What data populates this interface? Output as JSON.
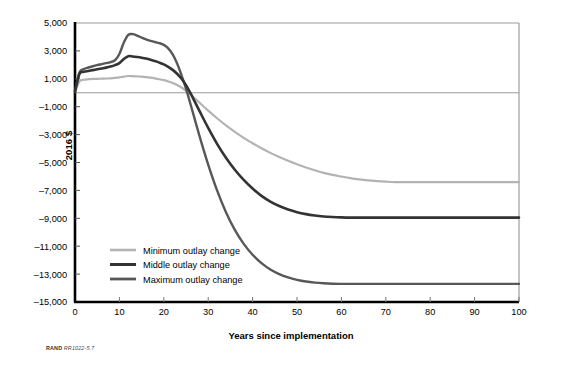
{
  "figure": {
    "source_prefix": "RAND",
    "source_id": "RR1022-5.7"
  },
  "chart_data": {
    "type": "line",
    "title": "",
    "xlabel": "Years since implementation",
    "ylabel": "2016 $",
    "xlim": [
      0,
      100
    ],
    "ylim": [
      -15000,
      5000
    ],
    "xticks": [
      0,
      10,
      20,
      30,
      40,
      50,
      60,
      70,
      80,
      90,
      100
    ],
    "xticklabels": [
      "0",
      "10",
      "20",
      "30",
      "40",
      "50",
      "60",
      "70",
      "80",
      "90",
      "100"
    ],
    "yticks": [
      5000,
      3000,
      1000,
      -1000,
      -3000,
      -5000,
      -7000,
      -9000,
      -11000,
      -13000,
      -15000
    ],
    "yticklabels": [
      "5,000",
      "3,000",
      "1,000",
      "–1,000",
      "–3,000",
      "–5,000",
      "–7,000",
      "–9,000",
      "–11,000",
      "–13,000",
      "–15,000"
    ],
    "grid": "horizontal gridlines at 5,000 (top frame) and 0 (zero reference line)",
    "zero_line": 0,
    "legend_position": "inside lower-left",
    "colors": {
      "minimum": "#b3b3b3",
      "middle": "#333333",
      "maximum": "#585858",
      "axis": "#000000",
      "gridline": "#9a9a9a",
      "frame": "#8a8a8a"
    },
    "x": [
      0,
      1,
      2,
      3,
      4,
      5,
      6,
      7,
      8,
      9,
      10,
      11,
      12,
      13,
      14,
      15,
      16,
      17,
      18,
      19,
      20,
      21,
      22,
      23,
      24,
      25,
      26,
      28,
      30,
      32,
      34,
      36,
      38,
      40,
      42,
      44,
      46,
      48,
      50,
      52,
      54,
      56,
      58,
      60,
      62,
      64,
      66,
      68,
      70,
      72,
      75,
      80,
      85,
      90,
      95,
      100
    ],
    "series": [
      {
        "name": "Minimum outlay change",
        "color": "#b3b3b3",
        "linewidth": 2.2,
        "plateau_value": -6400,
        "plateau_start_year": 72,
        "zero_crossing_year": 24,
        "peak_value": 1200,
        "peak_year": 12,
        "values": [
          50,
          800,
          930,
          970,
          990,
          1000,
          1010,
          1020,
          1030,
          1060,
          1100,
          1160,
          1200,
          1190,
          1170,
          1150,
          1120,
          1080,
          1030,
          970,
          900,
          810,
          700,
          560,
          380,
          150,
          -120,
          -700,
          -1280,
          -1830,
          -2340,
          -2800,
          -3230,
          -3620,
          -3980,
          -4310,
          -4610,
          -4880,
          -5130,
          -5360,
          -5560,
          -5740,
          -5890,
          -6010,
          -6120,
          -6210,
          -6280,
          -6330,
          -6370,
          -6400,
          -6400,
          -6400,
          -6400,
          -6400,
          -6400,
          -6400
        ]
      },
      {
        "name": "Middle outlay change",
        "color": "#333333",
        "linewidth": 2.6,
        "plateau_value": -8950,
        "plateau_start_year": 63,
        "zero_crossing_year": 25,
        "peak_value": 2620,
        "peak_year": 12,
        "values": [
          80,
          1350,
          1500,
          1560,
          1620,
          1680,
          1740,
          1800,
          1880,
          1980,
          2120,
          2420,
          2620,
          2600,
          2560,
          2510,
          2450,
          2370,
          2270,
          2160,
          2030,
          1860,
          1640,
          1360,
          1000,
          540,
          -20,
          -1280,
          -2520,
          -3660,
          -4660,
          -5520,
          -6250,
          -6870,
          -7390,
          -7800,
          -8120,
          -8370,
          -8560,
          -8700,
          -8800,
          -8870,
          -8910,
          -8935,
          -8950,
          -8950,
          -8950,
          -8950,
          -8950,
          -8950,
          -8950,
          -8950,
          -8950,
          -8950,
          -8950,
          -8950
        ]
      },
      {
        "name": "Maximum outlay change",
        "color": "#585858",
        "linewidth": 2.4,
        "plateau_value": -13700,
        "plateau_start_year": 62,
        "zero_crossing_year": 25,
        "peak_value": 4200,
        "peak_year": 12,
        "values": [
          100,
          1450,
          1700,
          1810,
          1900,
          1980,
          2050,
          2120,
          2200,
          2330,
          2780,
          3600,
          4150,
          4200,
          4100,
          3950,
          3820,
          3720,
          3640,
          3560,
          3430,
          3180,
          2750,
          2100,
          1250,
          300,
          -800,
          -3050,
          -5150,
          -7000,
          -8560,
          -9830,
          -10830,
          -11610,
          -12210,
          -12670,
          -13000,
          -13240,
          -13410,
          -13530,
          -13610,
          -13660,
          -13690,
          -13700,
          -13700,
          -13700,
          -13700,
          -13700,
          -13700,
          -13700,
          -13700,
          -13700,
          -13700,
          -13700,
          -13700,
          -13700
        ]
      }
    ],
    "legend_entries": [
      {
        "label": "Minimum outlay change",
        "color": "#b3b3b3"
      },
      {
        "label": "Middle outlay change",
        "color": "#333333"
      },
      {
        "label": "Maximum outlay change",
        "color": "#585858"
      }
    ]
  }
}
